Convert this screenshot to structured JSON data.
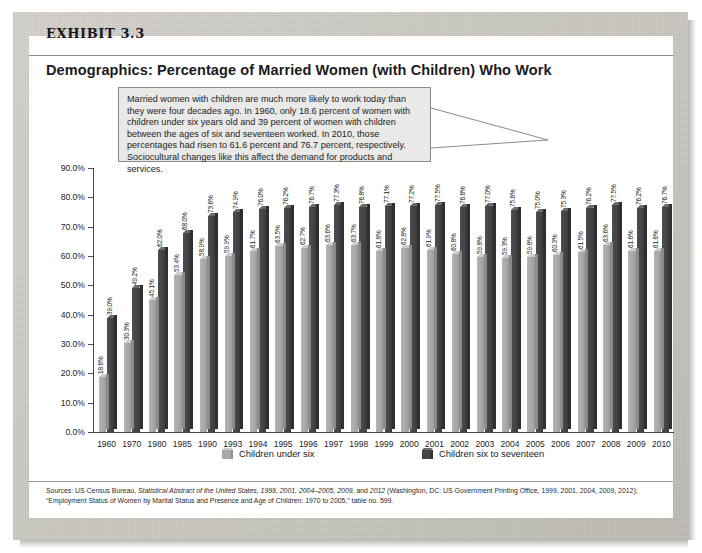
{
  "exhibit": {
    "label": "EXHIBIT 3.3",
    "title": "Demographics: Percentage of Married Women (with Children) Who Work"
  },
  "callout": {
    "text": "Married women with children are much more likely to work today than they were four decades ago. In 1960, only 18.6 percent of women with children under six years old and 39 percent of women with children between the ages of six and seventeen worked. In 2010, those percentages had risen to 61.6 percent and 76.7 percent, respectively. Sociocultural changes like this affect the demand for products and services."
  },
  "legend": {
    "items": [
      {
        "label": "Children under six",
        "color": "#a9a9a7"
      },
      {
        "label": "Children six to seventeen",
        "color": "#444446"
      }
    ]
  },
  "source": {
    "line1_pre": "Sources: US Census Bureau, ",
    "line1_italic1": "Statistical Abstract of the United States, 1999, 2001, 2004–2005, 2009,",
    "line1_mid": " and ",
    "line1_italic2": "2012",
    "line1_post": " (Washington, DC: US Government Printing Office, 1999, 2001, 2004, 2009, 2012); “Employment Status of Women by Marital Status and Presence and Age of Children: 1970 to 2005,” table no. 599."
  },
  "chart_data": {
    "type": "bar",
    "title": "Demographics: Percentage of Married Women (with Children) Who Work",
    "xlabel": "",
    "ylabel": "",
    "ylim": [
      0,
      90
    ],
    "ytick_labels": [
      "0.0%",
      "10.0%",
      "20.0%",
      "30.0%",
      "40.0%",
      "50.0%",
      "60.0%",
      "70.0%",
      "80.0%",
      "90.0%"
    ],
    "ytick_values": [
      0,
      10,
      20,
      30,
      40,
      50,
      60,
      70,
      80,
      90
    ],
    "grid": false,
    "legend_position": "bottom",
    "categories": [
      "1960",
      "1970",
      "1980",
      "1985",
      "1990",
      "1993",
      "1994",
      "1995",
      "1996",
      "1997",
      "1998",
      "1999",
      "2000",
      "2001",
      "2002",
      "2003",
      "2004",
      "2005",
      "2006",
      "2007",
      "2008",
      "2009",
      "2010"
    ],
    "series": [
      {
        "name": "Children under six",
        "color": "#a9a9a7",
        "values": [
          18.6,
          30.3,
          45.1,
          53.4,
          58.9,
          59.9,
          61.7,
          63.5,
          62.7,
          63.6,
          63.7,
          61.8,
          62.8,
          61.9,
          60.8,
          59.8,
          59.3,
          59.8,
          60.3,
          61.5,
          63.6,
          61.6,
          61.6
        ],
        "labels": [
          "18.6%",
          "30.3%",
          "45.1%",
          "53.4%",
          "58.9%",
          "59.9%",
          "61.7%",
          "63.5%",
          "62.7%",
          "63.6%",
          "63.7%",
          "61.8%",
          "62.8%",
          "61.9%",
          "60.8%",
          "59.8%",
          "59.3%",
          "59.8%",
          "60.3%",
          "61.5%",
          "63.6%",
          "61.6%",
          "61.6%"
        ]
      },
      {
        "name": "Children six to seventeen",
        "color": "#444446",
        "values": [
          39.0,
          49.2,
          62.0,
          68.0,
          73.6,
          74.9,
          76.0,
          76.2,
          76.7,
          77.3,
          76.8,
          77.1,
          77.2,
          77.5,
          76.8,
          77.0,
          75.6,
          75.0,
          75.3,
          76.2,
          77.5,
          76.2,
          76.7
        ],
        "labels": [
          "39.0%",
          "49.2%",
          "62.0%",
          "68.0%",
          "73.6%",
          "74.9%",
          "76.0%",
          "76.2%",
          "76.7%",
          "77.3%",
          "76.8%",
          "77.1%",
          "77.2%",
          "77.5%",
          "76.8%",
          "77.0%",
          "75.6%",
          "75.0%",
          "75.3%",
          "76.2%",
          "77.5%",
          "76.2%",
          "76.7%"
        ]
      }
    ]
  }
}
